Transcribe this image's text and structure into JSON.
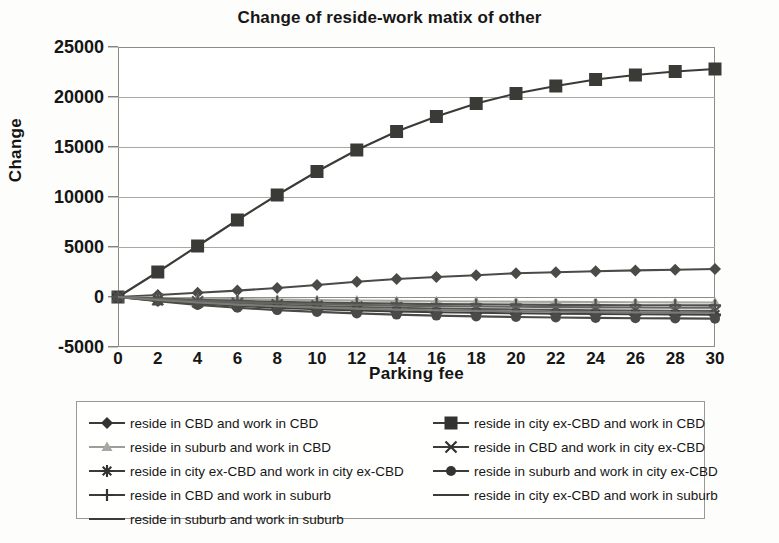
{
  "chart_data": {
    "type": "line",
    "title": "Change of reside-work matix of other",
    "xlabel": "Parking fee",
    "ylabel": "Change",
    "grid": true,
    "legend_position": "bottom",
    "xlim": [
      0,
      30
    ],
    "ylim": [
      -5000,
      25000
    ],
    "xticks": [
      "0",
      "2",
      "4",
      "6",
      "8",
      "10",
      "12",
      "14",
      "16",
      "18",
      "20",
      "22",
      "24",
      "26",
      "28",
      "30"
    ],
    "yticks": [
      "25000",
      "20000",
      "15000",
      "10000",
      "5000",
      "0",
      "-5000"
    ],
    "x": [
      0,
      2,
      4,
      6,
      8,
      10,
      12,
      14,
      16,
      18,
      20,
      22,
      24,
      26,
      28,
      30
    ],
    "series": [
      {
        "name": "reside in CBD and work in CBD",
        "marker": "diamond",
        "color": "#4a4a47",
        "values": [
          0,
          200,
          420,
          640,
          900,
          1200,
          1520,
          1800,
          2000,
          2180,
          2380,
          2480,
          2580,
          2660,
          2720,
          2800
        ]
      },
      {
        "name": "reside in city ex-CBD and work in CBD",
        "marker": "square",
        "color": "#3a3a37",
        "values": [
          0,
          2500,
          5100,
          7700,
          10200,
          12550,
          14700,
          16550,
          18050,
          19350,
          20350,
          21100,
          21750,
          22200,
          22550,
          22800
        ]
      },
      {
        "name": "reside in suburb and work in CBD",
        "marker": "triangle",
        "color": "#a8a8a3",
        "values": [
          0,
          -80,
          -150,
          -210,
          -260,
          -310,
          -350,
          -390,
          -420,
          -450,
          -470,
          -490,
          -510,
          -525,
          -540,
          -550
        ]
      },
      {
        "name": "reside in CBD and work in city ex-CBD",
        "marker": "x",
        "color": "#555552",
        "values": [
          0,
          -260,
          -470,
          -640,
          -780,
          -900,
          -1000,
          -1080,
          -1150,
          -1200,
          -1250,
          -1290,
          -1320,
          -1350,
          -1370,
          -1390
        ]
      },
      {
        "name": "reside in city ex-CBD and work in city ex-CBD",
        "marker": "asterisk",
        "color": "#3f3f3c",
        "values": [
          0,
          -360,
          -650,
          -880,
          -1070,
          -1220,
          -1340,
          -1440,
          -1520,
          -1580,
          -1630,
          -1670,
          -1700,
          -1725,
          -1745,
          -1760
        ]
      },
      {
        "name": "reside in suburb and work in city ex-CBD",
        "marker": "circle",
        "color": "#4a4a47",
        "values": [
          0,
          -430,
          -790,
          -1080,
          -1310,
          -1490,
          -1640,
          -1760,
          -1860,
          -1940,
          -2000,
          -2050,
          -2090,
          -2120,
          -2145,
          -2165
        ]
      },
      {
        "name": "reside in CBD and work in suburb",
        "marker": "plus",
        "color": "#4f4f4c",
        "values": [
          0,
          -150,
          -280,
          -390,
          -480,
          -555,
          -615,
          -665,
          -705,
          -740,
          -765,
          -788,
          -805,
          -820,
          -832,
          -842
        ]
      },
      {
        "name": "reside in city ex-CBD and work in suburb",
        "marker": "none",
        "color": "#636360",
        "values": [
          0,
          -200,
          -370,
          -510,
          -625,
          -720,
          -795,
          -858,
          -908,
          -950,
          -984,
          -1012,
          -1035,
          -1053,
          -1068,
          -1080
        ]
      },
      {
        "name": "reside in suburb and work in suburb",
        "marker": "none",
        "color": "#7a7a76",
        "values": [
          0,
          -300,
          -550,
          -755,
          -920,
          -1055,
          -1165,
          -1255,
          -1328,
          -1388,
          -1436,
          -1476,
          -1508,
          -1535,
          -1556,
          -1572
        ]
      }
    ]
  },
  "legend": {
    "columns": [
      {
        "items": [
          {
            "label": "reside in CBD and work in CBD",
            "marker": "diamond-marker",
            "tone": "dark"
          },
          {
            "label": "reside in suburb and work in CBD",
            "marker": "triangle-marker",
            "tone": "light"
          },
          {
            "label": "reside in city ex-CBD and work in city ex-CBD",
            "marker": "asterisk-marker",
            "tone": "dark"
          },
          {
            "label": "reside in CBD and work in suburb",
            "marker": "plus-marker",
            "tone": "dark"
          },
          {
            "label": "reside in suburb and work in suburb",
            "marker": "none-marker",
            "tone": "dark"
          }
        ]
      },
      {
        "items": [
          {
            "label": "reside in city ex-CBD and work in CBD",
            "marker": "square-marker",
            "tone": "dark"
          },
          {
            "label": "reside in CBD and work in city ex-CBD",
            "marker": "x-marker",
            "tone": "dark"
          },
          {
            "label": "reside in suburb and work in city ex-CBD",
            "marker": "circle-marker",
            "tone": "dark"
          },
          {
            "label": "reside in city ex-CBD and work in suburb",
            "marker": "none-marker",
            "tone": "dark"
          }
        ]
      }
    ]
  },
  "colors": {
    "frame": "#8d8d88",
    "grid": "#a9a9a4",
    "text": "#161616",
    "light_series": "#a8a8a3"
  }
}
